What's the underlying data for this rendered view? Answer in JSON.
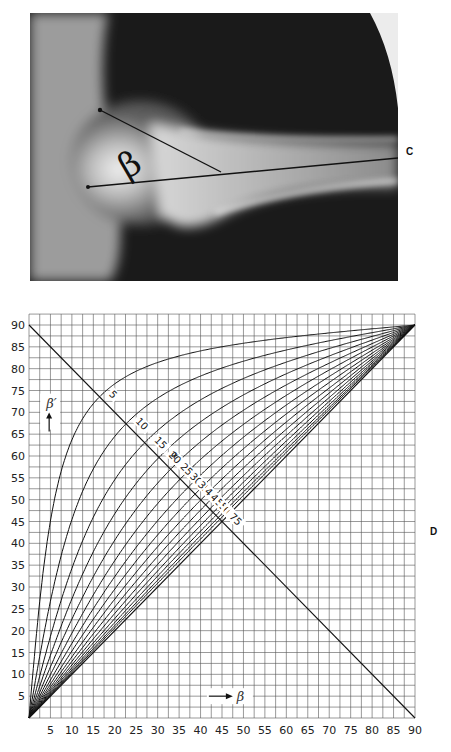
{
  "photo": {
    "label_beta": "β",
    "label_c": "C"
  },
  "chart_data": {
    "type": "line",
    "title": "",
    "xlabel": "β",
    "ylabel": "β′",
    "side_label": "D",
    "xlim": [
      0,
      90
    ],
    "ylim": [
      0,
      90
    ],
    "grid": true,
    "grid_step": 2.5,
    "x_ticks": [
      5,
      10,
      15,
      20,
      25,
      30,
      35,
      40,
      45,
      50,
      55,
      60,
      65,
      70,
      75,
      80,
      85,
      90
    ],
    "y_ticks": [
      5,
      10,
      15,
      20,
      25,
      30,
      35,
      40,
      45,
      50,
      55,
      60,
      65,
      70,
      75,
      80,
      85,
      90
    ],
    "relation": "tan(β′) = tan(β) / sin(α)",
    "series_parameter_marker": "α",
    "series": [
      {
        "name": "5",
        "alpha": 5
      },
      {
        "name": "10",
        "alpha": 10
      },
      {
        "name": "15",
        "alpha": 15
      },
      {
        "name": "20",
        "alpha": 20
      },
      {
        "name": "25",
        "alpha": 25
      },
      {
        "name": "30",
        "alpha": 30
      },
      {
        "name": "35",
        "alpha": 35
      },
      {
        "name": "40",
        "alpha": 40
      },
      {
        "name": "45",
        "alpha": 45
      },
      {
        "name": "50",
        "alpha": 50
      },
      {
        "name": "55",
        "alpha": 55
      },
      {
        "name": "60",
        "alpha": 60
      },
      {
        "name": "65",
        "alpha": 65
      },
      {
        "name": "70",
        "alpha": 70
      },
      {
        "name": "75",
        "alpha": 75
      }
    ],
    "reference_lines": [
      {
        "name": "anti-diagonal",
        "from": [
          0,
          90
        ],
        "to": [
          90,
          0
        ]
      },
      {
        "name": "diagonal-lower-bound",
        "from": [
          0,
          0
        ],
        "to": [
          90,
          90
        ]
      }
    ],
    "annotations": [
      {
        "text": "β′",
        "arrow": "up",
        "at": [
          4,
          72
        ]
      },
      {
        "text": "β",
        "arrow": "right",
        "at": [
          48,
          5
        ]
      }
    ]
  }
}
